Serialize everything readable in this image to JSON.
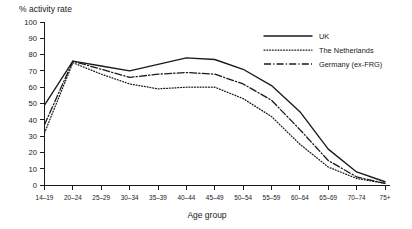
{
  "chart_data": {
    "type": "line",
    "title": "% activity rate",
    "xlabel": "Age group",
    "ylabel": "",
    "ylim": [
      0,
      100
    ],
    "ytick_step": 10,
    "yticks": [
      0,
      10,
      20,
      30,
      40,
      50,
      60,
      70,
      80,
      90,
      100
    ],
    "grid": false,
    "legend_position": "top-right",
    "categories": [
      "14–19",
      "20–24",
      "25–29",
      "30–34",
      "35–39",
      "40–44",
      "45–49",
      "50–54",
      "55–59",
      "60–64",
      "65–69",
      "70–74",
      "75+"
    ],
    "series": [
      {
        "name": "UK",
        "style": "solid",
        "color": "#1a1a1a",
        "values": [
          49,
          76,
          73,
          70,
          74,
          78,
          77,
          71,
          61,
          45,
          22,
          8,
          2
        ]
      },
      {
        "name": "The Netherlands",
        "style": "dotted",
        "color": "#1a1a1a",
        "values": [
          32,
          75,
          68,
          62,
          59,
          60,
          60,
          53,
          42,
          25,
          11,
          4,
          1
        ]
      },
      {
        "name": "Germany (ex-FRG)",
        "style": "dash-dot",
        "color": "#1a1a1a",
        "values": [
          37,
          76,
          71,
          66,
          68,
          69,
          68,
          62,
          52,
          34,
          15,
          5,
          1
        ]
      }
    ]
  },
  "legend": {
    "items": [
      {
        "label": "UK"
      },
      {
        "label": "The Netherlands"
      },
      {
        "label": "Germany (ex-FRG)"
      }
    ]
  }
}
